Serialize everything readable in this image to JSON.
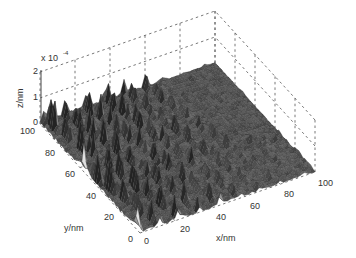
{
  "chart_data": {
    "type": "surface3d",
    "title": "",
    "xlabel": "x/nm",
    "ylabel": "y/nm",
    "zlabel": "z/nm",
    "z_multiplier": "x 10",
    "z_exponent": "-4",
    "xlim": [
      0,
      100
    ],
    "ylim": [
      0,
      100
    ],
    "zlim": [
      0,
      2
    ],
    "x_ticks": [
      "0",
      "20",
      "40",
      "60",
      "80",
      "100"
    ],
    "y_ticks": [
      "0",
      "20",
      "40",
      "60",
      "80",
      "100"
    ],
    "z_ticks": [
      "0",
      "1",
      "2"
    ],
    "grid": true,
    "grid_style": "dashed",
    "colormap": "grayscale"
  },
  "labels": {
    "x_axis": "x/nm",
    "y_axis": "y/nm",
    "z_axis": "z/nm",
    "z_scale_prefix": "x 10",
    "z_scale_exp": "-4"
  },
  "ticks": {
    "x": [
      "0",
      "20",
      "40",
      "60",
      "80",
      "100"
    ],
    "y": [
      "0",
      "20",
      "40",
      "60",
      "80",
      "100"
    ],
    "z": [
      "0",
      "1",
      "2"
    ]
  }
}
